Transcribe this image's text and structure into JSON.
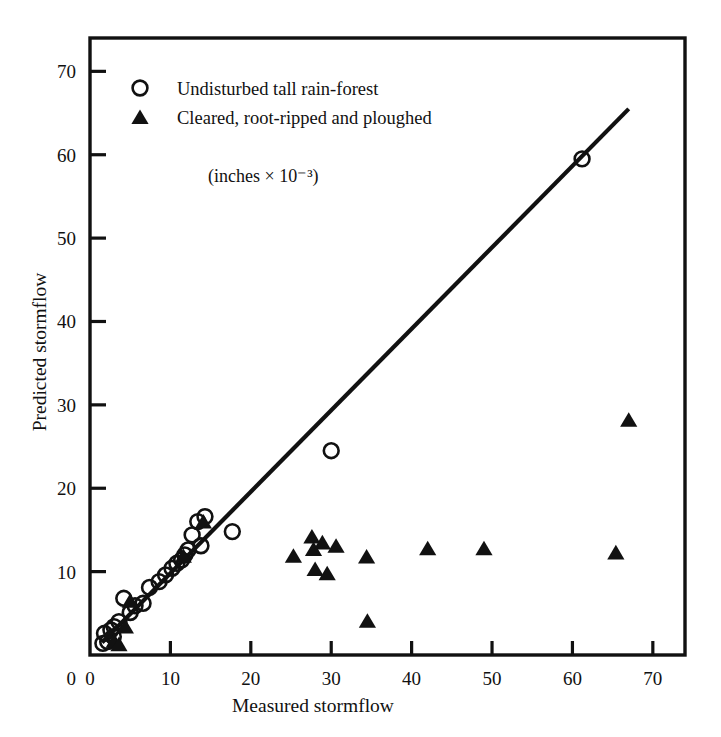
{
  "chart_data": {
    "type": "scatter",
    "title": "",
    "xlabel": "Measured      stormflow",
    "ylabel": "Predicted      stormflow",
    "units_note": "(inches × 10⁻³)",
    "xlim": [
      0,
      74
    ],
    "ylim": [
      0,
      74
    ],
    "xticks": [
      0,
      10,
      20,
      30,
      40,
      50,
      60,
      70
    ],
    "yticks": [
      0,
      10,
      20,
      30,
      40,
      50,
      60,
      70
    ],
    "xtick_labels": [
      "0",
      "10",
      "20",
      "30",
      "40",
      "50",
      "60",
      "70"
    ],
    "ytick_labels": [
      "0",
      "10",
      "20",
      "30",
      "40",
      "50",
      "60",
      "70"
    ],
    "grid": false,
    "legend_position": "upper-left",
    "reference_line": {
      "label": "1:1 line",
      "x": [
        1.5,
        67.0
      ],
      "y": [
        1.5,
        65.5
      ],
      "style": "solid"
    },
    "series": [
      {
        "name": "Undisturbed tall rain-forest",
        "marker": "open-circle",
        "color": "#111111",
        "points": [
          [
            1.6,
            1.4
          ],
          [
            1.8,
            2.6
          ],
          [
            2.2,
            1.6
          ],
          [
            2.6,
            3.0
          ],
          [
            2.9,
            2.2
          ],
          [
            3.0,
            3.4
          ],
          [
            3.6,
            4.0
          ],
          [
            4.2,
            6.8
          ],
          [
            5.0,
            5.1
          ],
          [
            5.6,
            5.9
          ],
          [
            6.6,
            6.2
          ],
          [
            7.4,
            8.1
          ],
          [
            8.6,
            8.8
          ],
          [
            9.4,
            9.6
          ],
          [
            10.2,
            10.4
          ],
          [
            10.8,
            11.0
          ],
          [
            11.4,
            11.4
          ],
          [
            11.8,
            12.0
          ],
          [
            12.2,
            12.6
          ],
          [
            12.7,
            14.4
          ],
          [
            13.4,
            16.0
          ],
          [
            13.8,
            13.1
          ],
          [
            14.3,
            16.6
          ],
          [
            17.7,
            14.8
          ],
          [
            30.0,
            24.5
          ],
          [
            61.2,
            59.5
          ]
        ]
      },
      {
        "name": "Cleared, root-ripped and ploughed",
        "marker": "filled-triangle",
        "color": "#111111",
        "points": [
          [
            3.0,
            1.6
          ],
          [
            3.6,
            1.2
          ],
          [
            4.4,
            3.3
          ],
          [
            5.0,
            6.4
          ],
          [
            11.6,
            11.8
          ],
          [
            14.1,
            15.9
          ],
          [
            25.3,
            11.8
          ],
          [
            27.6,
            14.1
          ],
          [
            27.8,
            12.6
          ],
          [
            28.0,
            10.2
          ],
          [
            28.9,
            13.4
          ],
          [
            29.5,
            9.7
          ],
          [
            30.6,
            13.0
          ],
          [
            34.4,
            11.7
          ],
          [
            34.5,
            4.0
          ],
          [
            42.0,
            12.7
          ],
          [
            49.0,
            12.7
          ],
          [
            65.4,
            12.2
          ],
          [
            67.0,
            28.1
          ]
        ]
      }
    ]
  },
  "legend": {
    "entries": [
      {
        "marker": "open-circle",
        "label": "Undisturbed tall rain-forest"
      },
      {
        "marker": "filled-triangle",
        "label": "Cleared, root-ripped and ploughed"
      }
    ]
  },
  "axes": {
    "x_title": "Measured      stormflow",
    "y_title": "Predicted      stormflow",
    "units": "(inches × 10⁻³)"
  },
  "colors": {
    "ink": "#111111",
    "background": "#ffffff"
  }
}
